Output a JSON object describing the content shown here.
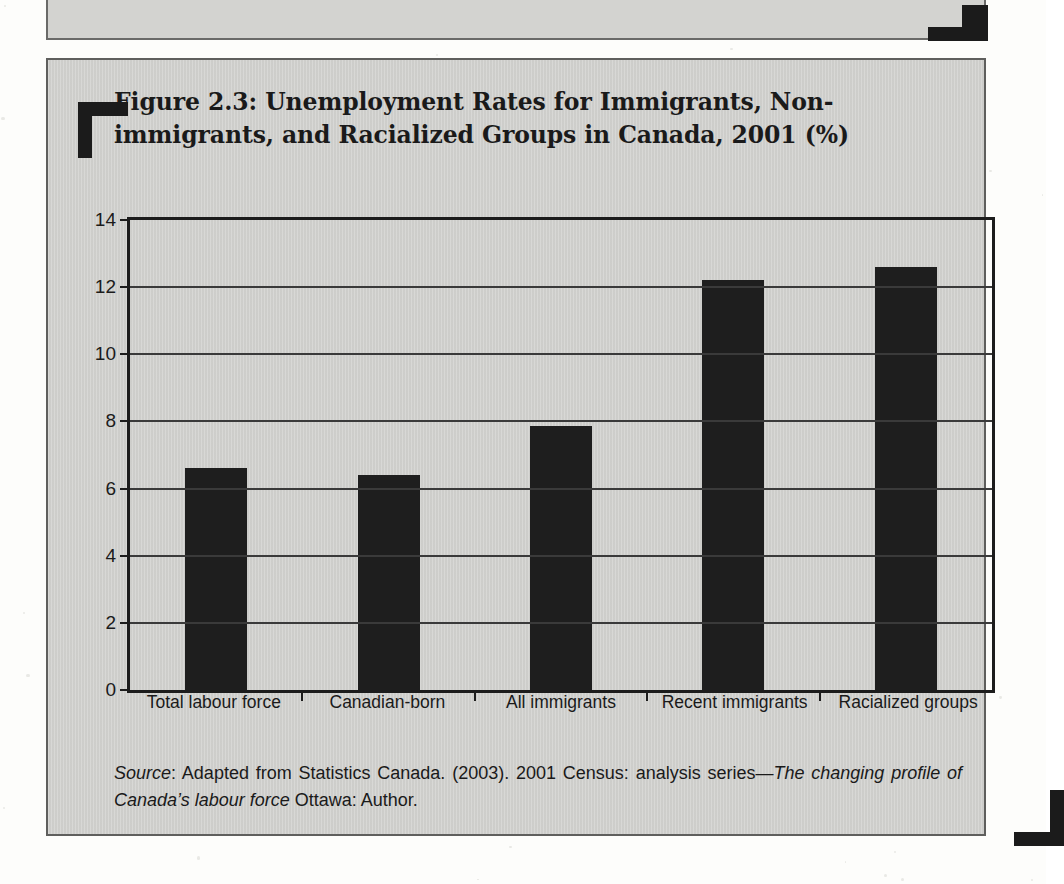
{
  "figure": {
    "title": "Figure 2.3: Unemployment Rates for Immigrants, Non-immigrants, and Racialized Groups in Canada, 2001 (%)",
    "source_prefix": "Source",
    "source_text": ": Adapted from Statistics Canada. (2003). 2001 Census: analysis series—",
    "source_italic_1": "The changing profile of Canada’s labour force",
    "source_suffix": " Ottawa: Author."
  },
  "chart_data": {
    "type": "bar",
    "title": "Figure 2.3: Unemployment Rates for Immigrants, Non-immigrants, and Racialized Groups in Canada, 2001 (%)",
    "xlabel": "",
    "ylabel": "",
    "categories": [
      "Total labour force",
      "Canadian-born",
      "All immigrants",
      "Recent immigrants",
      "Racialized groups"
    ],
    "values": [
      6.6,
      6.4,
      7.85,
      12.2,
      12.6
    ],
    "ylim": [
      0,
      14
    ],
    "yticks": [
      0,
      2,
      4,
      6,
      8,
      10,
      12,
      14
    ],
    "ytick_labels": [
      "0",
      "2",
      "4",
      "6",
      "8",
      "10",
      "12",
      "14"
    ],
    "grid": true,
    "legend": false,
    "bar_color": "#1e1e1e",
    "plot_background": "#d4d4d1"
  }
}
